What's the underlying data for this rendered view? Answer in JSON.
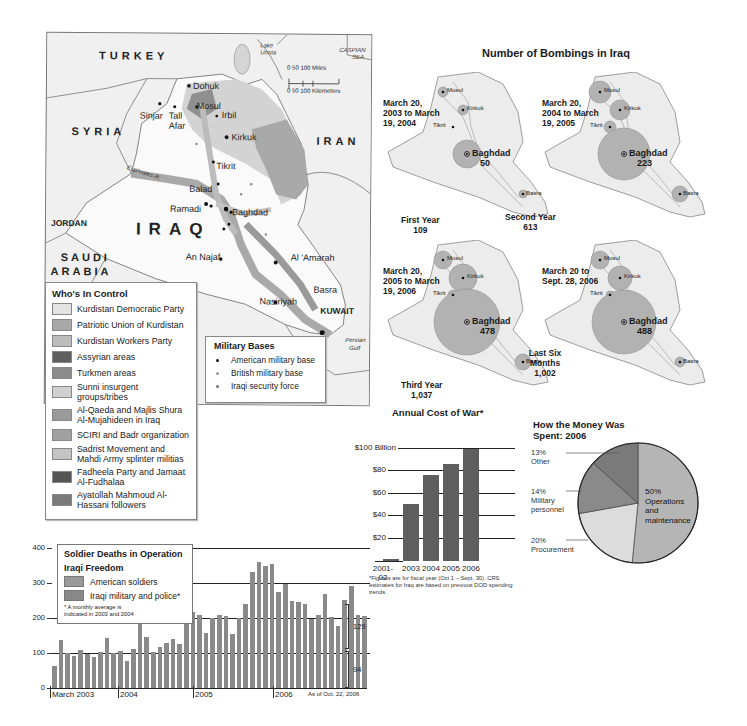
{
  "map": {
    "countries": {
      "turkey": "TURKEY",
      "syria": "SYRIA",
      "iran": "IRAN",
      "jordan": "JORDAN",
      "saudi1": "SAUDI",
      "saudi2": "ARABIA",
      "kuwait": "KUWAIT",
      "iraq": "IRAQ"
    },
    "water": {
      "urmia1": "Lake",
      "urmia2": "Urmia",
      "caspian1": "CASPIAN",
      "caspian2": "SEA",
      "gulf1": "Persian",
      "gulf2": "Gulf",
      "euphrates": "Euphrates R.",
      "tigris": "Tigris R."
    },
    "cities": {
      "dohuk": "Dohuk",
      "sinjar": "Sinjar",
      "tallafar1": "Tall",
      "tallafar2": "Afar",
      "mosul": "Mosul",
      "irbil": "Irbil",
      "kirkuk": "Kirkuk",
      "tikrit": "Tikrit",
      "balad": "Balad",
      "ramadi": "Ramadi",
      "baghdad": "Baghdad",
      "annajaf": "An Najaf",
      "alamarah": "Al 'Amarah",
      "nasiriyah": "Nasiriyah",
      "basra": "Basra"
    },
    "scale": {
      "miles": "0      50      100 Miles",
      "km": "0   50   100 Kilometers"
    }
  },
  "legend_control": {
    "title": "Who's In Control",
    "items": [
      {
        "label": "Kurdistan Democratic Party",
        "color": "#e3e3e3"
      },
      {
        "label": "Patriotic Union of Kurdistan",
        "color": "#a8a8a8"
      },
      {
        "label": "Kurdistan Workers Party",
        "color": "#bcbcbc"
      },
      {
        "label": "Assyrian areas",
        "color": "#5f5f5f"
      },
      {
        "label": "Turkmen areas",
        "color": "#8c8c8c"
      },
      {
        "label": "Sunni insurgent groups/tribes",
        "color": "#d0d0d0"
      },
      {
        "label": "Al-Qaeda and Majlis Shura Al-Mujahideen in Iraq",
        "color": "#9a9a9a"
      },
      {
        "label": "SCIRI and Badr organization",
        "color": "#a0a0a0"
      },
      {
        "label": "Sadrist Movement and Mahdi Army splinter militias",
        "color": "#c4c4c4"
      },
      {
        "label": "Fadheela Party and Jamaat Al-Fudhalaa",
        "color": "#555555"
      },
      {
        "label": "Ayatollah Mahmoud Al-Hassani followers",
        "color": "#7a7a7a"
      }
    ]
  },
  "legend_bases": {
    "title": "Military Bases",
    "items": [
      {
        "label": "American military base",
        "color": "#111111"
      },
      {
        "label": "British military base",
        "color": "#9a9a9a"
      },
      {
        "label": "Iraqi security force",
        "color": "#777777"
      }
    ]
  },
  "bombings": {
    "title": "Number of Bombings in Iraq",
    "panels": [
      {
        "date": "March 20, 2003 to March 19, 2004",
        "period": "First Year",
        "total": "109",
        "baghdad": "50"
      },
      {
        "date": "March 20, 2004 to March 19, 2005",
        "period": "Second Year",
        "total": "613",
        "baghdad": "223"
      },
      {
        "date": "March 20, 2005 to March 19, 2006",
        "period": "Third Year",
        "total": "1,037",
        "baghdad": "478"
      },
      {
        "date": "March 20 to Sept. 28, 2006",
        "period": "Last Six Months",
        "total": "1,002",
        "baghdad": "488"
      }
    ],
    "cities": {
      "mosul": "Mosul",
      "kirkuk": "Kirkuk",
      "tikrit": "Tikrit",
      "baghdad": "Baghdad",
      "basra": "Basra"
    }
  },
  "cost": {
    "title": "Annual Cost of War*",
    "ticks": [
      "$100 Billion",
      "$80",
      "$60",
      "$40",
      "$20"
    ],
    "categories": [
      "2001-02",
      "2003",
      "2004",
      "2005",
      "2006"
    ],
    "cat_labels": [
      "2001-\n02",
      "2003",
      "2004",
      "2005",
      "2006"
    ],
    "note": "*Figures are for fiscal year (Oct 1 – Sept. 30). CRS estimates for Iraq are based on previous DOD spending trends."
  },
  "pie": {
    "title1": "How the Money Was",
    "title2": "Spent:  2006",
    "slices": [
      {
        "pct": "50%",
        "label": "Operations and maintenance",
        "l1": "Operations",
        "l2": "and",
        "l3": "maintenance"
      },
      {
        "pct": "20%",
        "label": "Procurement"
      },
      {
        "pct": "14%",
        "label": "Military personnel",
        "l1": "Military",
        "l2": "personnel"
      },
      {
        "pct": "13%",
        "label": "Other"
      }
    ]
  },
  "deaths": {
    "legend_title1": "Soldier Deaths in Operation",
    "legend_title2": "Iraqi Freedom",
    "series1": "American soldiers",
    "series2": "Iraqi military and police*",
    "note1": "* A monthly average is",
    "note2": "indicated in 2003 and 2004",
    "yticks": [
      "400",
      "300",
      "200",
      "100",
      "0"
    ],
    "xlabels": [
      "March 2003",
      "2004",
      "2005",
      "2006"
    ],
    "asof": "As of Oct. 22, 2006",
    "brackets": [
      "129",
      "94"
    ]
  },
  "chart_data": [
    {
      "type": "bar",
      "title": "Annual Cost of War*",
      "categories": [
        "2001-02",
        "2003",
        "2004",
        "2005",
        "2006"
      ],
      "values": [
        2,
        51,
        77,
        87,
        100
      ],
      "ylabel": "Billion $",
      "ylim": [
        0,
        100
      ],
      "yticks": [
        20,
        40,
        60,
        80,
        100
      ],
      "grid": true,
      "note": "*Figures are for fiscal year (Oct 1 – Sept. 30). CRS estimates for Iraq are based on previous DOD spending trends."
    },
    {
      "type": "pie",
      "title": "How the Money Was Spent: 2006",
      "categories": [
        "Operations and maintenance",
        "Procurement",
        "Military personnel",
        "Other"
      ],
      "values": [
        50,
        20,
        14,
        13
      ]
    },
    {
      "type": "bar",
      "title": "Soldier Deaths in Operation Iraqi Freedom",
      "series": [
        {
          "name": "American soldiers + Iraqi military and police (stacked total)",
          "values": [
            63,
            137,
            100,
            91,
            109,
            97,
            89,
            103,
            143,
            100,
            106,
            77,
            111,
            206,
            146,
            103,
            117,
            129,
            140,
            126,
            197,
            217,
            209,
            157,
            200,
            209,
            206,
            154,
            200,
            240,
            331,
            360,
            349,
            354,
            274,
            297,
            249,
            246,
            240,
            197,
            209,
            269,
            203,
            177,
            251,
            291,
            209,
            206
          ]
        }
      ],
      "x_start": "March 2003",
      "x_end": "Oct 2006",
      "xlabels": [
        "March 2003",
        "2004",
        "2005",
        "2006"
      ],
      "ylim": [
        0,
        400
      ],
      "yticks": [
        0,
        100,
        200,
        300,
        400
      ],
      "annotations": [
        "129",
        "94",
        "As of Oct. 22, 2006",
        "* A monthly average is indicated in 2003 and 2004"
      ],
      "grid": true
    },
    {
      "type": "bubble-map",
      "title": "Number of Bombings in Iraq",
      "periods": [
        "March 20, 2003 to March 19, 2004",
        "March 20, 2004 to March 19, 2005",
        "March 20, 2005 to March 19, 2006",
        "March 20 to Sept. 28, 2006"
      ],
      "totals": [
        109,
        613,
        1037,
        1002
      ],
      "baghdad": [
        50,
        223,
        478,
        488
      ]
    }
  ]
}
